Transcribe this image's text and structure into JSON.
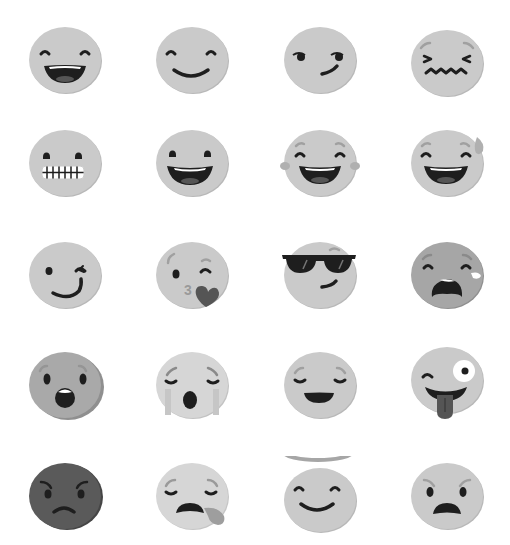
{
  "sheet": {
    "title": "Emoji set",
    "colors": {
      "face": "#c9c9c9",
      "face_shade": "#b7b7b7",
      "face_dark": "#595959",
      "face_mid": "#a8a8a8",
      "face_light": "#d6d6d6",
      "feature": "#1e1e1e",
      "brow": "#a0a0a0",
      "heart": "#555555",
      "tongue": "#555555"
    },
    "emojis": [
      {
        "row": 0,
        "col": 0,
        "name": "grinning-face-with-smiling-eyes",
        "cx": 65,
        "cy": 60
      },
      {
        "row": 0,
        "col": 1,
        "name": "smiling-face",
        "cx": 192,
        "cy": 60
      },
      {
        "row": 0,
        "col": 2,
        "name": "smirking-face",
        "cx": 320,
        "cy": 60
      },
      {
        "row": 0,
        "col": 3,
        "name": "confounded-face",
        "cx": 447,
        "cy": 63
      },
      {
        "row": 1,
        "col": 0,
        "name": "grimacing-face",
        "cx": 65,
        "cy": 163
      },
      {
        "row": 1,
        "col": 1,
        "name": "grinning-face",
        "cx": 192,
        "cy": 163
      },
      {
        "row": 1,
        "col": 2,
        "name": "face-with-tears-of-joy",
        "cx": 320,
        "cy": 163
      },
      {
        "row": 1,
        "col": 3,
        "name": "grinning-face-with-sweat",
        "cx": 447,
        "cy": 163
      },
      {
        "row": 2,
        "col": 0,
        "name": "winking-face",
        "cx": 65,
        "cy": 275
      },
      {
        "row": 2,
        "col": 1,
        "name": "face-blowing-a-kiss",
        "cx": 192,
        "cy": 275
      },
      {
        "row": 2,
        "col": 2,
        "name": "smiling-face-with-sunglasses",
        "cx": 320,
        "cy": 275
      },
      {
        "row": 2,
        "col": 3,
        "name": "loudly-crying-face",
        "cx": 447,
        "cy": 275
      },
      {
        "row": 3,
        "col": 0,
        "name": "face-with-open-mouth",
        "cx": 65,
        "cy": 385
      },
      {
        "row": 3,
        "col": 1,
        "name": "weary-face",
        "cx": 192,
        "cy": 385
      },
      {
        "row": 3,
        "col": 2,
        "name": "relieved-face",
        "cx": 320,
        "cy": 385
      },
      {
        "row": 3,
        "col": 3,
        "name": "winking-face-with-tongue",
        "cx": 447,
        "cy": 380
      },
      {
        "row": 4,
        "col": 0,
        "name": "pouting-face",
        "cx": 65,
        "cy": 496
      },
      {
        "row": 4,
        "col": 1,
        "name": "sleeping-face",
        "cx": 192,
        "cy": 496
      },
      {
        "row": 4,
        "col": 2,
        "name": "smiling-face-with-halo",
        "cx": 320,
        "cy": 496
      },
      {
        "row": 4,
        "col": 3,
        "name": "angry-face",
        "cx": 447,
        "cy": 496
      }
    ],
    "kiss_glyph": "3"
  }
}
